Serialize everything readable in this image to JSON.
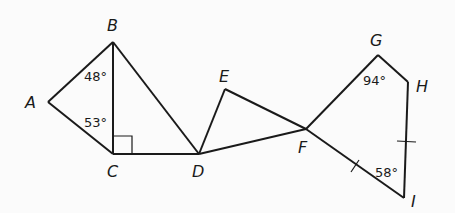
{
  "diagram": {
    "type": "geometry-figure",
    "points": {
      "A": {
        "label": "A",
        "x": 48,
        "y": 102
      },
      "B": {
        "label": "B",
        "x": 113,
        "y": 42
      },
      "C": {
        "label": "C",
        "x": 113,
        "y": 154
      },
      "D": {
        "label": "D",
        "x": 199,
        "y": 154
      },
      "E": {
        "label": "E",
        "x": 225,
        "y": 89
      },
      "F": {
        "label": "F",
        "x": 306,
        "y": 129
      },
      "G": {
        "label": "G",
        "x": 378,
        "y": 55
      },
      "H": {
        "label": "H",
        "x": 408,
        "y": 82
      },
      "I": {
        "label": "I",
        "x": 404,
        "y": 198
      }
    },
    "segments": [
      "AB",
      "AC",
      "BC",
      "BD",
      "CD",
      "DE",
      "DF",
      "EF",
      "FG",
      "GH",
      "HI",
      "FI"
    ],
    "angles": {
      "ABC": "48°",
      "ACB": "53°",
      "BCD": "right angle",
      "FGH": "94°",
      "FIH": "58°"
    },
    "congruent_marks": [
      "FI",
      "HI"
    ]
  }
}
